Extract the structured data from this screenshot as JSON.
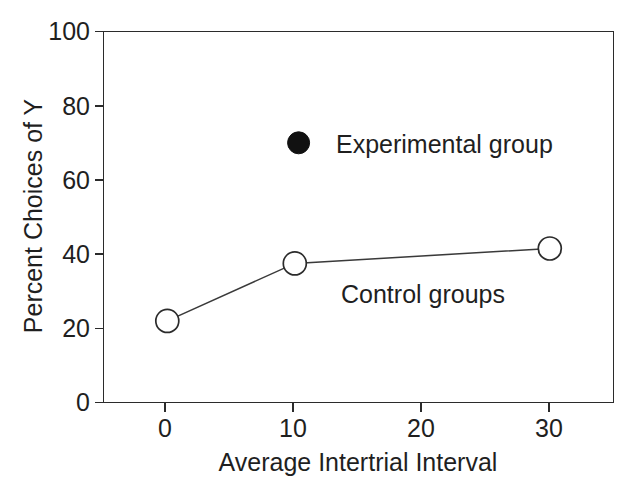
{
  "chart_data": {
    "type": "line",
    "title": "",
    "subtitle": "",
    "xlabel": "Average Intertrial Interval",
    "ylabel": "Percent Choices of Y",
    "xlim": [
      -5,
      35
    ],
    "ylim": [
      0,
      100
    ],
    "x_ticks": [
      0,
      10,
      20,
      30
    ],
    "x_tick_labels": [
      "0",
      "10",
      "20",
      "30"
    ],
    "y_ticks": [
      0,
      20,
      40,
      60,
      80,
      100
    ],
    "y_tick_labels": [
      "0",
      "20",
      "40",
      "60",
      "80",
      "100"
    ],
    "grid": false,
    "legend_position": "inside-upper-center",
    "series": [
      {
        "name": "Control groups",
        "marker": "open-circle",
        "line": "solid",
        "x": [
          0,
          10,
          30
        ],
        "values": [
          22,
          37.5,
          41.5
        ]
      },
      {
        "name": "Experimental group",
        "marker": "filled-circle",
        "line": "none",
        "x": [
          10.3
        ],
        "values": [
          70
        ]
      }
    ],
    "annotations": [
      {
        "text": "Control groups",
        "x": 17.5,
        "y": 29
      }
    ],
    "legend_entries": [
      {
        "label": "Experimental group",
        "marker": "filled-circle"
      }
    ]
  },
  "axes": {
    "y_title": "Percent Choices of Y",
    "x_title": "Average Intertrial Interval"
  },
  "labels": {
    "y_100": "100",
    "y_80": "80",
    "y_60": "60",
    "y_40": "40",
    "y_20": "20",
    "y_0": "0",
    "x_0": "0",
    "x_10": "10",
    "x_20": "20",
    "x_30": "30"
  },
  "legend": {
    "experimental_label": "Experimental group"
  },
  "annotations": {
    "control_label": "Control groups"
  }
}
